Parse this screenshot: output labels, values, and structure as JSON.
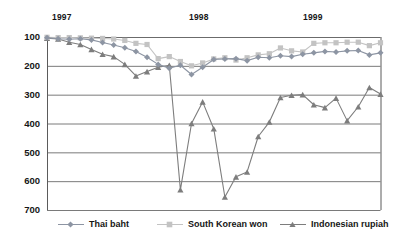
{
  "chart_data": {
    "type": "line",
    "title": "",
    "xlabel": "",
    "ylabel": "",
    "ylim": [
      100,
      700
    ],
    "y_inverted": true,
    "grid": true,
    "y_ticks": [
      100,
      200,
      300,
      400,
      500,
      600,
      700
    ],
    "x_tick_labels": [
      "1997",
      "1998",
      "1999"
    ],
    "x_tick_positions": [
      0,
      12,
      24
    ],
    "legend_position": "bottom",
    "x": [
      0,
      1,
      2,
      3,
      4,
      5,
      6,
      7,
      8,
      9,
      10,
      11,
      12,
      13,
      14,
      15,
      16,
      17,
      18,
      19,
      20,
      21,
      22,
      23,
      24,
      25,
      26,
      27,
      28,
      29,
      30
    ],
    "series": [
      {
        "name": "Thai baht",
        "marker": "diamond",
        "color": "#8d95a3",
        "values": [
          103,
          106,
          108,
          106,
          110,
          119,
          128,
          137,
          150,
          170,
          195,
          208,
          198,
          230,
          205,
          178,
          176,
          175,
          182,
          170,
          172,
          165,
          168,
          160,
          155,
          150,
          152,
          148,
          147,
          162,
          155
        ]
      },
      {
        "name": "South Korean won",
        "marker": "square",
        "color": "#c3c3c3",
        "values": [
          101,
          102,
          102,
          103,
          104,
          105,
          107,
          112,
          122,
          126,
          175,
          168,
          185,
          200,
          190,
          176,
          172,
          180,
          172,
          162,
          158,
          138,
          148,
          152,
          122,
          120,
          120,
          118,
          118,
          130,
          120
        ]
      },
      {
        "name": "Indonesian rupiah",
        "marker": "triangle",
        "color": "#7d7d7d",
        "values": [
          104,
          107,
          118,
          126,
          143,
          160,
          168,
          195,
          235,
          220,
          205,
          198,
          630,
          400,
          325,
          418,
          655,
          585,
          568,
          445,
          395,
          310,
          302,
          300,
          335,
          345,
          312,
          390,
          342,
          275,
          298
        ]
      }
    ],
    "series_colors": {
      "thai_baht": "#8d95a3",
      "south_korean_won": "#c3c3c3",
      "indonesian_rupiah": "#7d7d7d"
    },
    "axis_color": "#5b5b5b",
    "grid_color": "#6b6b6b"
  },
  "legend": {
    "items": [
      {
        "label": "Thai baht",
        "marker": "diamond-marker-icon"
      },
      {
        "label": "South Korean won",
        "marker": "square-marker-icon"
      },
      {
        "label": "Indonesian rupiah",
        "marker": "triangle-marker-icon"
      }
    ]
  }
}
